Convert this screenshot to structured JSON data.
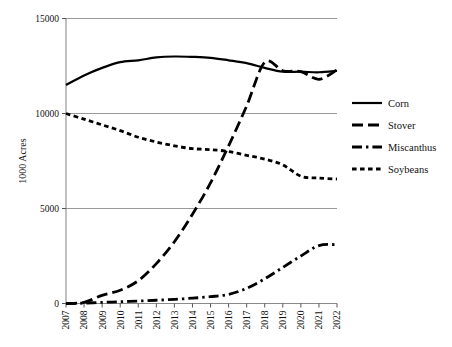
{
  "chart_data": {
    "type": "line",
    "title": "",
    "xlabel": "",
    "ylabel": "1000 Acres",
    "x": [
      2007,
      2008,
      2009,
      2010,
      2011,
      2012,
      2013,
      2014,
      2015,
      2016,
      2017,
      2018,
      2019,
      2020,
      2021,
      2022
    ],
    "xtick_labels": [
      "2007",
      "2008",
      "2009",
      "2010",
      "2011",
      "2012",
      "2013",
      "2014",
      "2015",
      "2016",
      "2017",
      "2018",
      "2019",
      "2020",
      "2021",
      "2022"
    ],
    "ytick_labels": [
      "0",
      "5000",
      "10000",
      "15000"
    ],
    "yticks": [
      0,
      5000,
      10000,
      15000
    ],
    "ylim": [
      0,
      15000
    ],
    "xlim": [
      2007,
      2022
    ],
    "grid": "horizontal",
    "legend_position": "right",
    "series": [
      {
        "name": "Corn",
        "style": "solid",
        "values": [
          11500,
          12000,
          12400,
          12700,
          12800,
          12950,
          13000,
          12980,
          12930,
          12800,
          12650,
          12400,
          12200,
          12200,
          12170,
          12250
        ]
      },
      {
        "name": "Stover",
        "style": "long-dash",
        "values": [
          0,
          60,
          430,
          700,
          1200,
          2100,
          3250,
          4700,
          6350,
          8300,
          10400,
          12700,
          12250,
          12200,
          11800,
          12300
        ]
      },
      {
        "name": "Miscanthus",
        "style": "dash-dot",
        "values": [
          0,
          20,
          60,
          90,
          130,
          170,
          220,
          280,
          360,
          480,
          800,
          1300,
          1900,
          2500,
          3050,
          3100
        ]
      },
      {
        "name": "Soybeans",
        "style": "short-dash",
        "values": [
          10000,
          9700,
          9400,
          9100,
          8750,
          8500,
          8300,
          8150,
          8100,
          8000,
          7800,
          7600,
          7300,
          6700,
          6600,
          6550
        ]
      }
    ]
  },
  "legend": {
    "items": [
      {
        "label": "Corn"
      },
      {
        "label": "Stover"
      },
      {
        "label": "Miscanthus"
      },
      {
        "label": "Soybeans"
      }
    ]
  }
}
